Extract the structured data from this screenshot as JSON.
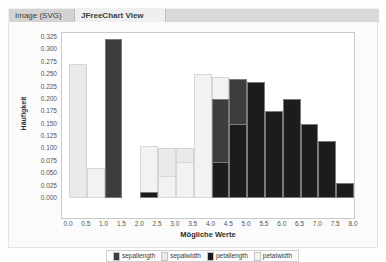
{
  "window": {
    "tabs": [
      {
        "id": "image-svg",
        "label": "Image (SVG)",
        "active": false
      },
      {
        "id": "jfreechart-view",
        "label": "JFreeChart View",
        "active": true
      }
    ]
  },
  "chart_data": {
    "type": "bar",
    "title": "",
    "xlabel": "Mögliche Werte",
    "ylabel": "Häufigkeit",
    "xlim": [
      0.0,
      8.0
    ],
    "ylim": [
      0.0,
      0.325
    ],
    "grid": false,
    "legend_position": "bottom",
    "xticks": [
      "0.0",
      "0.5",
      "1.0",
      "1.5",
      "2.0",
      "2.5",
      "3.0",
      "3.5",
      "4.0",
      "4.5",
      "5.0",
      "5.5",
      "6.0",
      "6.5",
      "7.0",
      "7.5",
      "8.0"
    ],
    "yticks": [
      "0.000",
      "0.025",
      "0.050",
      "0.075",
      "0.100",
      "0.125",
      "0.150",
      "0.175",
      "0.200",
      "0.225",
      "0.250",
      "0.275",
      "0.300",
      "0.325"
    ],
    "bin_width": 0.5,
    "colors": {
      "sepallength": "#3d3d3d",
      "sepalwidth": "#eaeaea",
      "petallength": "#1c1c1c",
      "petalwidth": "#f2f2f2"
    },
    "series": [
      {
        "name": "sepallength",
        "color": "#3d3d3d",
        "bars": [
          {
            "x0": 1.0,
            "x1": 1.5,
            "value": 0.32
          },
          {
            "x0": 4.0,
            "x1": 4.5,
            "value": 0.2
          },
          {
            "x0": 4.5,
            "x1": 5.0,
            "value": 0.24
          }
        ]
      },
      {
        "name": "sepalwidth",
        "color": "#eaeaea",
        "bars": [
          {
            "x0": 0.0,
            "x1": 0.5,
            "value": 0.27
          },
          {
            "x0": 2.0,
            "x1": 2.5,
            "value": 0.105
          },
          {
            "x0": 2.5,
            "x1": 3.0,
            "value": 0.1
          },
          {
            "x0": 3.0,
            "x1": 3.5,
            "value": 0.1
          },
          {
            "x0": 3.5,
            "x1": 4.0,
            "value": 0.25
          }
        ]
      },
      {
        "name": "petallength",
        "color": "#1c1c1c",
        "bars": [
          {
            "x0": 2.0,
            "x1": 2.5,
            "value": 0.012
          },
          {
            "x0": 4.0,
            "x1": 4.5,
            "value": 0.072
          },
          {
            "x0": 4.5,
            "x1": 5.0,
            "value": 0.15
          },
          {
            "x0": 5.0,
            "x1": 5.5,
            "value": 0.235
          },
          {
            "x0": 5.5,
            "x1": 6.0,
            "value": 0.175
          },
          {
            "x0": 6.0,
            "x1": 6.5,
            "value": 0.2
          },
          {
            "x0": 6.5,
            "x1": 7.0,
            "value": 0.15
          },
          {
            "x0": 7.0,
            "x1": 7.5,
            "value": 0.115
          },
          {
            "x0": 7.5,
            "x1": 8.0,
            "value": 0.03
          }
        ]
      },
      {
        "name": "petalwidth",
        "color": "#f2f2f2",
        "bars": [
          {
            "x0": 0.5,
            "x1": 1.0,
            "value": 0.06
          },
          {
            "x0": 2.0,
            "x1": 2.5,
            "value": 0.105
          },
          {
            "x0": 2.5,
            "x1": 3.0,
            "value": 0.045
          },
          {
            "x0": 3.0,
            "x1": 3.5,
            "value": 0.072
          },
          {
            "x0": 3.5,
            "x1": 4.0,
            "value": 0.25
          },
          {
            "x0": 4.0,
            "x1": 4.5,
            "value": 0.245
          },
          {
            "x0": 4.5,
            "x1": 5.0,
            "value": 0.03
          }
        ]
      }
    ],
    "legend": [
      {
        "label": "sepallength",
        "color": "#3d3d3d"
      },
      {
        "label": "sepalwidth",
        "color": "#eaeaea"
      },
      {
        "label": "petallength",
        "color": "#1c1c1c"
      },
      {
        "label": "petalwidth",
        "color": "#f2f2f2"
      }
    ]
  }
}
